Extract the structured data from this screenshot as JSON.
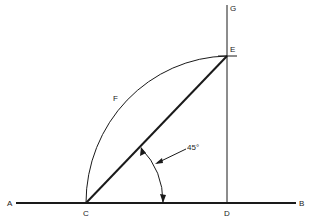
{
  "diagram": {
    "type": "geometric-construction",
    "points": {
      "A": {
        "label": "A",
        "x": 10,
        "y": 206
      },
      "B": {
        "label": "B",
        "x": 302,
        "y": 206
      },
      "C": {
        "label": "C",
        "x": 86,
        "y": 216
      },
      "D": {
        "label": "D",
        "x": 227,
        "y": 216
      },
      "E": {
        "label": "E",
        "x": 232,
        "y": 52
      },
      "F": {
        "label": "F",
        "x": 114,
        "y": 100
      },
      "G": {
        "label": "G",
        "x": 231,
        "y": 11
      }
    },
    "angle_label": "45°",
    "colors": {
      "stroke": "#1a1a1a",
      "background": "#ffffff"
    }
  }
}
